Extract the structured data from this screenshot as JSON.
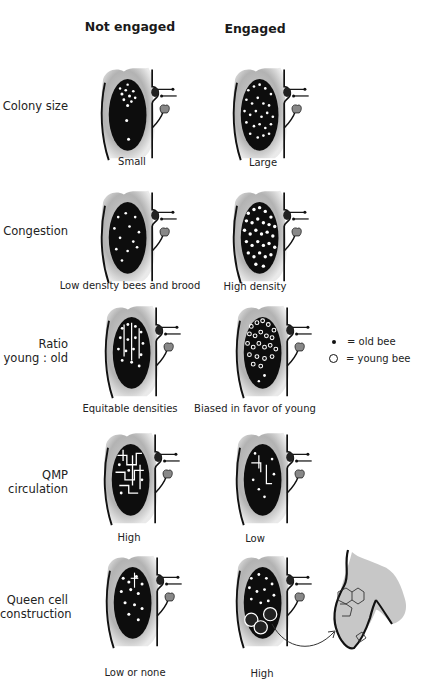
{
  "headers": {
    "not_engaged": "Not engaged",
    "engaged": "Engaged"
  },
  "rows": [
    {
      "label": "Colony size",
      "not_engaged_caption": "Small",
      "engaged_caption": "Large"
    },
    {
      "label": "Congestion",
      "not_engaged_caption": "Low density bees and brood",
      "engaged_caption": "High density"
    },
    {
      "label_line1": "Ratio",
      "label_line2": "young : old",
      "not_engaged_caption": "Equitable densities",
      "engaged_caption": "Biased in favor of young"
    },
    {
      "label_line1": "QMP",
      "label_line2": "circulation",
      "not_engaged_caption": "High",
      "engaged_caption": "Low"
    },
    {
      "label_line1": "Queen cell",
      "label_line2": "construction",
      "not_engaged_caption": "Low or none",
      "engaged_caption": "High"
    }
  ],
  "legend": {
    "old_bee": "= old bee",
    "young_bee": "= young bee",
    "old_bee_icon": "filled-dot",
    "young_bee_icon": "open-circle"
  },
  "colors": {
    "ink": "#111111",
    "wash": "#9a9a9a",
    "background": "#ffffff"
  }
}
